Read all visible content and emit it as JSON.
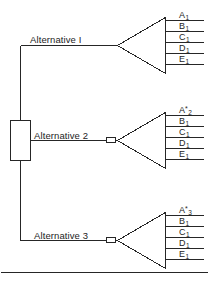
{
  "figure": {
    "kind": "decision-tree-diagram",
    "stroke_color": "#262626",
    "text_color": "#1d1d1d",
    "background": "#ffffff"
  },
  "decision_node": {
    "name": "decision-square",
    "shape": "square"
  },
  "branches": [
    {
      "id": "alternative-1",
      "label": "Alternative I",
      "has_chance_marker": false,
      "outcomes": [
        {
          "base": "A",
          "sub": "1",
          "star": false
        },
        {
          "base": "B",
          "sub": "1",
          "star": false
        },
        {
          "base": "C",
          "sub": "1",
          "star": false
        },
        {
          "base": "D",
          "sub": "1",
          "star": false
        },
        {
          "base": "E",
          "sub": "1",
          "star": false
        }
      ]
    },
    {
      "id": "alternative-2",
      "label": "Alternative 2",
      "has_chance_marker": true,
      "outcomes": [
        {
          "base": "A",
          "sub": "2",
          "star": true
        },
        {
          "base": "B",
          "sub": "1",
          "star": false
        },
        {
          "base": "C",
          "sub": "1",
          "star": false
        },
        {
          "base": "D",
          "sub": "1",
          "star": false
        },
        {
          "base": "E",
          "sub": "1",
          "star": false
        }
      ]
    },
    {
      "id": "alternative-3",
      "label": "Alternative 3",
      "has_chance_marker": true,
      "outcomes": [
        {
          "base": "A",
          "sub": "3",
          "star": true
        },
        {
          "base": "B",
          "sub": "1",
          "star": false
        },
        {
          "base": "C",
          "sub": "1",
          "star": false
        },
        {
          "base": "D",
          "sub": "1",
          "star": false
        },
        {
          "base": "E",
          "sub": "1",
          "star": false
        }
      ]
    }
  ],
  "footer_rule": {
    "name": "bottom-divider",
    "visible": true
  }
}
